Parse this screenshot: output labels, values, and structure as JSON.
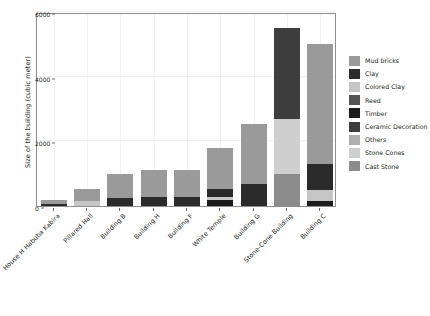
{
  "chart_data": {
    "type": "bar",
    "subtype": "stacked-bar",
    "title": "",
    "xlabel": "",
    "ylabel": "Size of the building (cubic meter)",
    "ylim": [
      0,
      6000
    ],
    "yticks": [
      0,
      2000,
      4000,
      6000
    ],
    "ytick_labels": [
      "0",
      "2000",
      "4000",
      "6000"
    ],
    "grid": true,
    "legend_position": "right",
    "categories": [
      "House H Habuba Kabira",
      "Pillared Hall",
      "Building B",
      "Building H",
      "Building F",
      "White Temple",
      "Building G",
      "Stone-Cone Building",
      "Building C"
    ],
    "series": [
      {
        "name": "Mud bricks",
        "color": "#9a9a9a",
        "values": [
          120,
          400,
          740,
          830,
          830,
          1270,
          1880,
          0,
          3700
        ]
      },
      {
        "name": "Clay",
        "color": "#2b2b2b",
        "values": [
          70,
          0,
          250,
          280,
          290,
          330,
          670,
          0,
          800
        ]
      },
      {
        "name": "Colored Clay",
        "color": "#c6c6c6",
        "values": [
          0,
          140,
          0,
          0,
          0,
          0,
          0,
          0,
          350
        ]
      },
      {
        "name": "Reed",
        "color": "#545454",
        "values": [
          0,
          0,
          0,
          0,
          0,
          0,
          0,
          0,
          0
        ]
      },
      {
        "name": "Timber",
        "color": "#1c1c1c",
        "values": [
          0,
          0,
          0,
          0,
          0,
          190,
          0,
          0,
          160
        ]
      },
      {
        "name": "Ceramic Decoration",
        "color": "#3d3d3d",
        "values": [
          0,
          0,
          0,
          0,
          0,
          0,
          0,
          2800,
          0
        ]
      },
      {
        "name": "Others",
        "color": "#b0b0b0",
        "values": [
          0,
          0,
          0,
          0,
          0,
          0,
          0,
          0,
          0
        ]
      },
      {
        "name": "Stone Cones",
        "color": "#cfcfcf",
        "values": [
          0,
          0,
          0,
          0,
          0,
          0,
          0,
          1700,
          0
        ]
      },
      {
        "name": "Cast Stone",
        "color": "#8c8c8c",
        "values": [
          0,
          0,
          0,
          0,
          0,
          0,
          0,
          1000,
          0
        ]
      }
    ],
    "totals": [
      190,
      540,
      990,
      1110,
      1120,
      1790,
      2550,
      5500,
      5010
    ],
    "stacks": [
      {
        "category": "House H Habuba Kabira",
        "segments": [
          {
            "name": "Clay",
            "value": 70,
            "color": "#2b2b2b"
          },
          {
            "name": "Mud bricks",
            "value": 120,
            "color": "#9a9a9a"
          }
        ]
      },
      {
        "category": "Pillared Hall",
        "segments": [
          {
            "name": "Colored Clay",
            "value": 140,
            "color": "#c6c6c6"
          },
          {
            "name": "Mud bricks",
            "value": 400,
            "color": "#9a9a9a"
          }
        ]
      },
      {
        "category": "Building B",
        "segments": [
          {
            "name": "Clay",
            "value": 250,
            "color": "#2b2b2b"
          },
          {
            "name": "Mud bricks",
            "value": 740,
            "color": "#9a9a9a"
          }
        ]
      },
      {
        "category": "Building H",
        "segments": [
          {
            "name": "Clay",
            "value": 280,
            "color": "#2b2b2b"
          },
          {
            "name": "Mud bricks",
            "value": 830,
            "color": "#9a9a9a"
          }
        ]
      },
      {
        "category": "Building F",
        "segments": [
          {
            "name": "Clay",
            "value": 290,
            "color": "#2b2b2b"
          },
          {
            "name": "Mud bricks",
            "value": 830,
            "color": "#9a9a9a"
          }
        ]
      },
      {
        "category": "White Temple",
        "segments": [
          {
            "name": "Timber",
            "value": 190,
            "color": "#1c1c1c"
          },
          {
            "name": "Colored Clay",
            "value": 100,
            "color": "#c6c6c6"
          },
          {
            "name": "Clay",
            "value": 230,
            "color": "#2b2b2b"
          },
          {
            "name": "Mud bricks",
            "value": 1270,
            "color": "#9a9a9a"
          }
        ]
      },
      {
        "category": "Building G",
        "segments": [
          {
            "name": "Clay",
            "value": 670,
            "color": "#2b2b2b"
          },
          {
            "name": "Mud bricks",
            "value": 1880,
            "color": "#9a9a9a"
          }
        ]
      },
      {
        "category": "Stone-Cone Building",
        "segments": [
          {
            "name": "Cast Stone",
            "value": 1000,
            "color": "#8c8c8c"
          },
          {
            "name": "Stone Cones",
            "value": 1700,
            "color": "#cfcfcf"
          },
          {
            "name": "Ceramic Decoration",
            "value": 2800,
            "color": "#3d3d3d"
          }
        ]
      },
      {
        "category": "Building C",
        "segments": [
          {
            "name": "Timber",
            "value": 160,
            "color": "#1c1c1c"
          },
          {
            "name": "Colored Clay",
            "value": 350,
            "color": "#c6c6c6"
          },
          {
            "name": "Clay",
            "value": 800,
            "color": "#2b2b2b"
          },
          {
            "name": "Mud bricks",
            "value": 3700,
            "color": "#9a9a9a"
          }
        ]
      }
    ]
  },
  "legend": {
    "items": [
      {
        "label": "Mud bricks",
        "color": "#9a9a9a"
      },
      {
        "label": "Clay",
        "color": "#2b2b2b"
      },
      {
        "label": "Colored Clay",
        "color": "#c6c6c6"
      },
      {
        "label": "Reed",
        "color": "#545454"
      },
      {
        "label": "Timber",
        "color": "#1c1c1c"
      },
      {
        "label": "Ceramic Decoration",
        "color": "#3d3d3d"
      },
      {
        "label": "Others",
        "color": "#b0b0b0"
      },
      {
        "label": "Stone Cones",
        "color": "#cfcfcf"
      },
      {
        "label": "Cast Stone",
        "color": "#8c8c8c"
      }
    ]
  },
  "axes": {
    "y_title": "Size of the building (cubic meter)"
  }
}
